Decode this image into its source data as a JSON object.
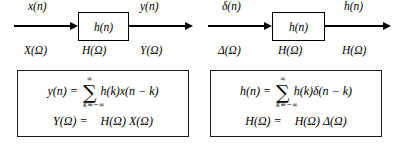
{
  "figure": {
    "colors": {
      "ink": "#000000",
      "box_border": "#1a1a1a",
      "background": "#ffffff"
    }
  },
  "panels": [
    {
      "id": "general-input",
      "block_label": "h(n)",
      "input_time_label": "x(n)",
      "output_time_label": "y(n)",
      "input_freq_label": "X(Ω)",
      "block_freq_label": "H(Ω)",
      "output_freq_label": "Y(Ω)",
      "equation": {
        "time_lhs": "y(n) =",
        "sum_upper": "∞",
        "sum_sign": "∑",
        "sum_lower": "k=−∞",
        "time_rhs": "h(k)x(n − k)",
        "freq_lhs": "Y(Ω) =",
        "freq_rhs": "H(Ω) X(Ω)"
      }
    },
    {
      "id": "impulse-input",
      "block_label": "h(n)",
      "input_time_label": "δ(n)",
      "output_time_label": "h(n)",
      "input_freq_label": "Δ(Ω)",
      "block_freq_label": "H(Ω)",
      "output_freq_label": "H(Ω)",
      "equation": {
        "time_lhs": "h(n) =",
        "sum_upper": "∞",
        "sum_sign": "∑",
        "sum_lower": "k=−∞",
        "time_rhs": "h(k)δ(n − k)",
        "freq_lhs": "H(Ω) =",
        "freq_rhs": "H(Ω) Δ(Ω)"
      }
    }
  ]
}
